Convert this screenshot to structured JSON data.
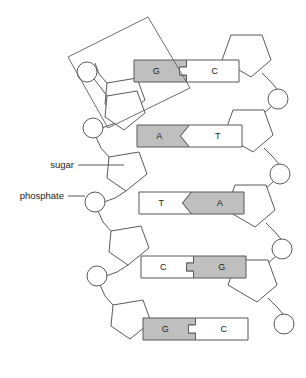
{
  "figure": {
    "background_color": "#ffffff",
    "line_color": "#59595b",
    "purine_fill": "#bfbfbf",
    "pyrimidine_fill": "#ffffff",
    "text_color": "#1b1b1b",
    "highlight_color": "#6d6d70"
  },
  "callouts": [
    {
      "id": "sugar",
      "label": "sugar",
      "target": "sugar-pentagon"
    },
    {
      "id": "phosphate",
      "label": "phosphate",
      "target": "phosphate-circle"
    }
  ],
  "highlight": {
    "name": "nucleotide-highlight-box",
    "description": "rotated rectangle outlining one nucleotide (phosphate, sugar, base)"
  },
  "rungs": [
    {
      "index": 1,
      "left_base": "G",
      "right_base": "C",
      "left_type": "purine",
      "right_type": "pyrimidine",
      "joint": "square",
      "bonds": 3
    },
    {
      "index": 2,
      "left_base": "A",
      "right_base": "T",
      "left_type": "purine",
      "right_type": "pyrimidine",
      "joint": "triangle",
      "bonds": 2
    },
    {
      "index": 3,
      "left_base": "T",
      "right_base": "A",
      "left_type": "pyrimidine",
      "right_type": "purine",
      "joint": "triangle",
      "bonds": 2
    },
    {
      "index": 4,
      "left_base": "C",
      "right_base": "G",
      "left_type": "pyrimidine",
      "right_type": "purine",
      "joint": "square",
      "bonds": 3
    },
    {
      "index": 5,
      "left_base": "G",
      "right_base": "C",
      "left_type": "purine",
      "right_type": "pyrimidine",
      "joint": "square",
      "bonds": 3
    }
  ]
}
